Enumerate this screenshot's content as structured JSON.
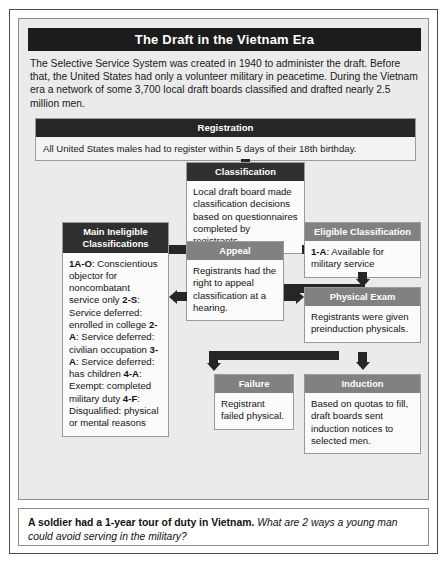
{
  "figure": {
    "title": "The Draft in the Vietnam Era",
    "intro": "The Selective Service System was created in 1940 to administer the draft. Before that, the United States had only a volunteer military in peacetime. During the Vietnam era a network of some 3,700 local draft boards classified and drafted nearly 2.5 million men."
  },
  "registration": {
    "header": "Registration",
    "text": "All United States males had to register within 5 days of their 18th birthday."
  },
  "nodes": {
    "classification": {
      "header": "Classification",
      "text": "Local draft board made classification decisions based on questionnaires completed by registrants."
    },
    "ineligible": {
      "header_line1": "Main Ineligible",
      "header_line2": "Classifications",
      "items": [
        {
          "code": "1A-O",
          "text": ": Conscientious objector for noncombatant service only"
        },
        {
          "code": "2-S",
          "text": ": Service deferred: enrolled in college"
        },
        {
          "code": "2-A",
          "text": ": Service deferred: civilian occupation"
        },
        {
          "code": "3-A",
          "text": ": Service deferred: has children"
        },
        {
          "code": "4-A",
          "text": ": Exempt: completed military duty"
        },
        {
          "code": "4-F",
          "text": ": Disqualified: physical or mental reasons"
        }
      ]
    },
    "appeal": {
      "header": "Appeal",
      "text": "Registrants had the right to appeal classification at a hearing."
    },
    "eligible": {
      "header": "Eligible Classification",
      "code": "1-A",
      "text": ": Available for military service"
    },
    "physical_exam": {
      "header": "Physical Exam",
      "text": "Registrants were given preinduction physicals."
    },
    "failure": {
      "header": "Failure",
      "text": "Registrant failed physical."
    },
    "induction": {
      "header": "Induction",
      "text": "Based on quotas to fill, draft boards sent induction notices to selected men."
    }
  },
  "caption": {
    "lead": "A soldier had a 1-year tour of duty in Vietnam.",
    "question": "What are 2 ways a young man could avoid serving in the military?"
  },
  "colors": {
    "header_dark": "#303030",
    "header_gray": "#818181",
    "title_bar": "#1c1c1c",
    "connector": "#262626",
    "panel_bg": "#ebebeb"
  }
}
